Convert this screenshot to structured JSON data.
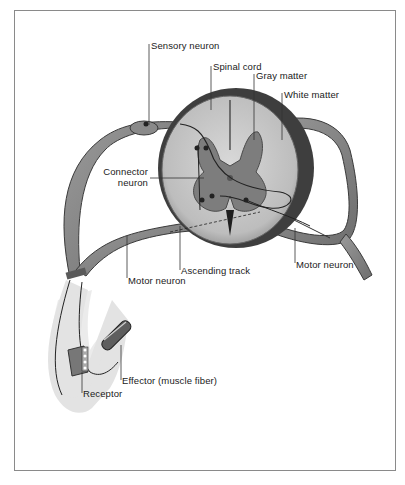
{
  "diagram": {
    "labels": {
      "sensory_neuron": "Sensory neuron",
      "spinal_cord": "Spinal cord",
      "gray_matter": "Gray matter",
      "white_matter": "White matter",
      "connector_neuron_line1": "Connector",
      "connector_neuron_line2": "neuron",
      "motor_neuron_left": "Motor neuron",
      "ascending_track": "Ascending track",
      "motor_neuron_right": "Motor neuron",
      "effector": "Effector (muscle fiber)",
      "receptor": "Receptor"
    },
    "colors": {
      "frame": "#8a8a8a",
      "white_matter": "#c9c9c9",
      "gray_matter": "#7d7d7d",
      "nerve": "#a9a9a9",
      "nerve_outline": "#3a3a3a",
      "limb": "#d6d6d6",
      "text": "#1a1a1a"
    }
  }
}
